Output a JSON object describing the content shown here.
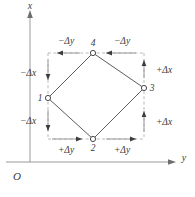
{
  "figure": {
    "axes": {
      "vertical_label": "x",
      "horizontal_label": "y",
      "origin_label": "O",
      "vertical_direction": "up",
      "horizontal_direction": "right"
    },
    "nodes": [
      {
        "id": "1",
        "label": "1",
        "position": "left",
        "cx": 48,
        "cy": 98
      },
      {
        "id": "2",
        "label": "2",
        "position": "bottom",
        "cx": 93,
        "cy": 139
      },
      {
        "id": "3",
        "label": "3",
        "position": "right",
        "cx": 144,
        "cy": 88
      },
      {
        "id": "4",
        "label": "4",
        "position": "top",
        "cx": 93,
        "cy": 53
      }
    ],
    "dimension_labels": [
      {
        "id": "top-left",
        "text": "−Δy",
        "side": "top",
        "arrow_direction": "left"
      },
      {
        "id": "top-right",
        "text": "−Δy",
        "side": "top",
        "arrow_direction": "left"
      },
      {
        "id": "right-upper",
        "text": "+Δx",
        "side": "right",
        "arrow_direction": "up"
      },
      {
        "id": "right-lower",
        "text": "+Δx",
        "side": "right",
        "arrow_direction": "up"
      },
      {
        "id": "bottom-left",
        "text": "+Δy",
        "side": "bottom",
        "arrow_direction": "right"
      },
      {
        "id": "bottom-right",
        "text": "+Δy",
        "side": "bottom",
        "arrow_direction": "right"
      },
      {
        "id": "left-upper",
        "text": "−Δx",
        "side": "left",
        "arrow_direction": "down"
      },
      {
        "id": "left-lower",
        "text": "−Δx",
        "side": "left",
        "arrow_direction": "down"
      }
    ],
    "colors": {
      "background": "#ffffff",
      "axis": "#9a9a9a",
      "dashed_guide": "#b3b3b3",
      "quad_edge": "#5d5d5d",
      "text": "#3a3a3a",
      "arrow": "#3d3d3d"
    }
  }
}
